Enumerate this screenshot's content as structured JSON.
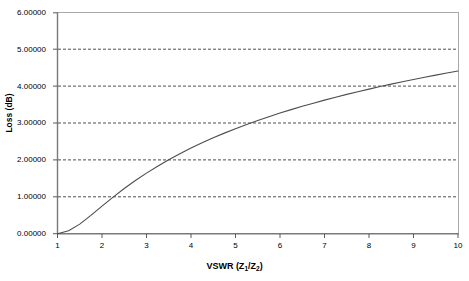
{
  "chart_data": {
    "type": "line",
    "title": "",
    "xlabel": "VSWR (Z₁/Z₂)",
    "ylabel": "Loss (dB)",
    "xlim": [
      1,
      10
    ],
    "ylim": [
      0,
      6
    ],
    "grid": true,
    "grid_axis": "y",
    "legend": "none",
    "xticks": [
      "1",
      "2",
      "3",
      "4",
      "5",
      "6",
      "7",
      "8",
      "9",
      "10"
    ],
    "yticks": [
      "0.00000",
      "1.00000",
      "2.00000",
      "3.00000",
      "4.00000",
      "5.00000",
      "6.00000"
    ],
    "series": [
      {
        "name": "Mismatch Loss",
        "x": [
          1,
          1.25,
          1.5,
          1.75,
          2,
          2.25,
          2.5,
          2.75,
          3,
          3.25,
          3.5,
          3.75,
          4,
          4.25,
          4.5,
          4.75,
          5,
          5.25,
          5.5,
          5.75,
          6,
          6.25,
          6.5,
          6.75,
          7,
          7.25,
          7.5,
          7.75,
          8,
          8.25,
          8.5,
          8.75,
          9,
          9.25,
          9.5,
          9.75,
          10
        ],
        "values": [
          0.0,
          0.0537,
          0.1774,
          0.3401,
          0.5115,
          0.6793,
          0.8381,
          0.9864,
          1.1244,
          1.2528,
          1.3724,
          1.4842,
          1.5888,
          1.687,
          1.7794,
          1.8665,
          1.9489,
          2.0269,
          2.1009,
          2.1713,
          2.2385,
          2.3025,
          2.3638,
          2.4225,
          2.4788,
          2.5329,
          2.585,
          2.6351,
          2.6835,
          2.7302,
          2.7754,
          2.8192,
          2.8617,
          2.9029,
          2.9429,
          2.9818,
          3.0196
        ]
      }
    ],
    "curve_reference_points": [
      {
        "vswr": 1,
        "loss": 0.0
      },
      {
        "vswr": 2.7,
        "loss": 1.0
      },
      {
        "vswr": 4.15,
        "loss": 2.0
      },
      {
        "vswr": 5.8,
        "loss": 3.0
      },
      {
        "vswr": 8.0,
        "loss": 4.0
      },
      {
        "vswr": 10,
        "loss": 4.85
      }
    ],
    "colors": {
      "curve": "#4d4d4d",
      "axis": "#808080",
      "gridline": "#333333",
      "background": "#ffffff"
    }
  },
  "axis": {
    "x_title": "VSWR (Z",
    "x_title_sub1": "1",
    "x_title_mid": "/Z",
    "x_title_sub2": "2",
    "x_title_end": ")",
    "y_title": "Loss (dB)"
  }
}
